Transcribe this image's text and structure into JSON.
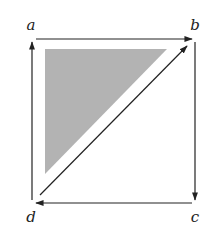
{
  "diagram": {
    "type": "commutative-square",
    "vertices": [
      {
        "id": "a",
        "label": "a",
        "x": 32,
        "y": 39,
        "label_x": 31,
        "label_y": 30
      },
      {
        "id": "b",
        "label": "b",
        "x": 195,
        "y": 39,
        "label_x": 195,
        "label_y": 30
      },
      {
        "id": "c",
        "label": "c",
        "x": 195,
        "y": 203,
        "label_x": 195,
        "label_y": 222
      },
      {
        "id": "d",
        "label": "d",
        "x": 32,
        "y": 203,
        "label_x": 31,
        "label_y": 222
      }
    ],
    "edges": [
      {
        "from": "a",
        "to": "b"
      },
      {
        "from": "b",
        "to": "c"
      },
      {
        "from": "c",
        "to": "d"
      },
      {
        "from": "d",
        "to": "a"
      },
      {
        "from": "d",
        "to": "b"
      }
    ],
    "shaded_region": {
      "description": "triangle a-b-d (upper-left)",
      "points": [
        [
          45,
          49
        ],
        [
          167,
          49
        ],
        [
          45,
          174
        ]
      ],
      "fill": "#b3b3b3"
    },
    "colors": {
      "stroke": "#222222",
      "background": "#ffffff"
    }
  }
}
